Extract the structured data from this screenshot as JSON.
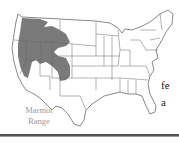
{
  "figure": {
    "shaded_region_label": "Marmot Range",
    "caption_lines": [
      "Marmot",
      "Range"
    ],
    "shade_color": "#7a7a7a",
    "outline_color": "#555555"
  },
  "body_text": {
    "fragments": [
      "fe",
      "a"
    ]
  }
}
